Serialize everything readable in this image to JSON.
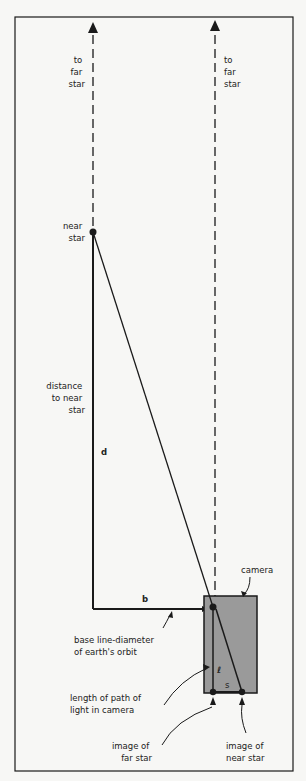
{
  "diagram": {
    "labels": {
      "to_far_star_left": [
        "to",
        "far",
        "star"
      ],
      "to_far_star_right": [
        "to",
        "far",
        "star"
      ],
      "near_star": [
        "near",
        "star"
      ],
      "distance": [
        "distance",
        "to near",
        "star"
      ],
      "d": "d",
      "b": "b",
      "camera": "camera",
      "baseline": [
        "base line-diameter",
        "of earth's orbit"
      ],
      "l": "ℓ",
      "s": "s",
      "path_length": [
        "length of path of",
        "light in camera"
      ],
      "image_far": [
        "image of",
        "far  star"
      ],
      "image_near": [
        "image of",
        "near star"
      ]
    },
    "colors": {
      "background": "#f7f7f5",
      "line": "#1a1a1a",
      "camera_fill": "#9a9a9a"
    }
  }
}
